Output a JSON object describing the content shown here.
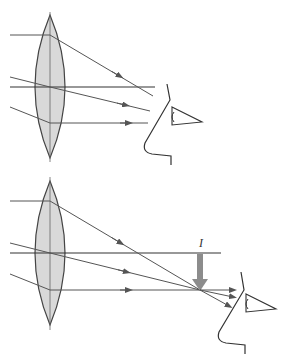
{
  "colors": {
    "lens_fill": "#d9d9d9",
    "lens_stroke": "#444444",
    "ray": "#555555",
    "axis": "#333333",
    "image_arrow": "#8c8c8c",
    "face": "#333333"
  },
  "panels": [
    {
      "id": "top",
      "description": "Parallel-ish rays pass through lens; eye looks at converging rays",
      "image_label": ""
    },
    {
      "id": "bottom",
      "description": "Rays converge to form a real image, shown by downward arrow, then diverge into eye",
      "image_label": "I"
    }
  ]
}
